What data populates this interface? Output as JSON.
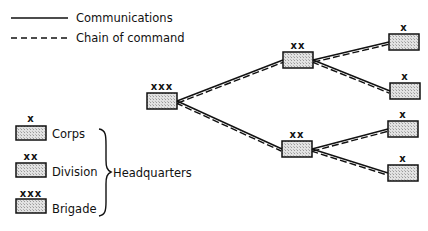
{
  "legend": {
    "communications_label": "Communications",
    "chain_of_command_label": "Chain of command"
  },
  "key": {
    "items": [
      {
        "mark": "x",
        "label": "Corps"
      },
      {
        "mark": "xx",
        "label": "Division"
      },
      {
        "mark": "xxx",
        "label": "Brigade"
      }
    ],
    "group_label": "Headquarters"
  },
  "tree": {
    "root": {
      "mark": "xxx",
      "level": "Brigade"
    },
    "divisions": [
      {
        "mark": "xx",
        "level": "Division",
        "children": [
          {
            "mark": "x",
            "level": "Corps"
          },
          {
            "mark": "x",
            "level": "Corps"
          }
        ]
      },
      {
        "mark": "xx",
        "level": "Division",
        "children": [
          {
            "mark": "x",
            "level": "Corps"
          },
          {
            "mark": "x",
            "level": "Corps"
          }
        ]
      }
    ]
  },
  "colors": {
    "line": "#111111",
    "box_fill": "#d9d9d9"
  }
}
